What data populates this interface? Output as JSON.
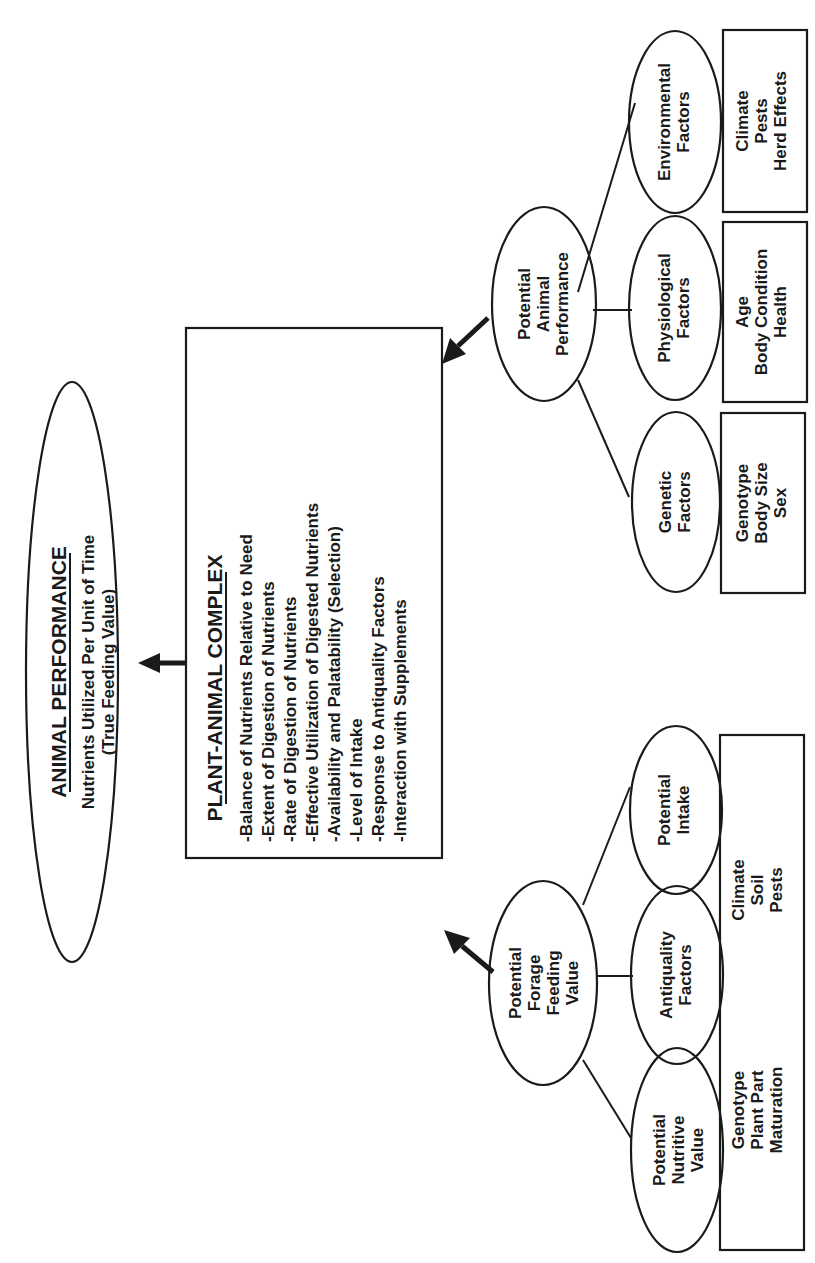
{
  "diagram": {
    "orientation": "rotated-90-ccw",
    "root": {
      "title": "ANIMAL PERFORMANCE",
      "subtitle_line1": "Nutrients Utilized Per Unit of Time",
      "subtitle_line2": "(True Feeding Value)"
    },
    "complex": {
      "title": "PLANT-ANIMAL COMPLEX",
      "items": [
        "-Balance of Nutrients Relative to Need",
        "-Extent of Digestion of Nutrients",
        "-Rate of Digestion of Nutrients",
        "-Effective Utilization of Digested Nutrients",
        "-Availability and Palatability (Selection)",
        "-Level of Intake",
        "-Response to Antiquality Factors",
        "-Interaction with Supplements"
      ]
    },
    "forage_branch": {
      "node": [
        "Potential",
        "Forage",
        "Feeding",
        "Value"
      ],
      "children": [
        {
          "label": [
            "Potential",
            "Nutritive",
            "Value"
          ]
        },
        {
          "label": [
            "Antiquality",
            "Factors"
          ]
        },
        {
          "label": [
            "Potential",
            "Intake"
          ]
        }
      ],
      "box_groups": [
        [
          "Genotype",
          "Plant Part",
          "Maturation"
        ],
        [
          "Climate",
          "Soil",
          "Pests"
        ]
      ]
    },
    "animal_branch": {
      "node": [
        "Potential",
        "Animal",
        "Performance"
      ],
      "children": [
        {
          "label": [
            "Genetic",
            "Factors"
          ],
          "box": [
            "Genotype",
            "Body Size",
            "Sex"
          ]
        },
        {
          "label": [
            "Physiological",
            "Factors"
          ],
          "box": [
            "Age",
            "Body Condition",
            "Health"
          ]
        },
        {
          "label": [
            "Environmental",
            "Factors"
          ],
          "box": [
            "Climate",
            "Pests",
            "Herd Effects"
          ]
        }
      ]
    },
    "colors": {
      "ink": "#1a1a1a",
      "background": "#ffffff"
    }
  }
}
